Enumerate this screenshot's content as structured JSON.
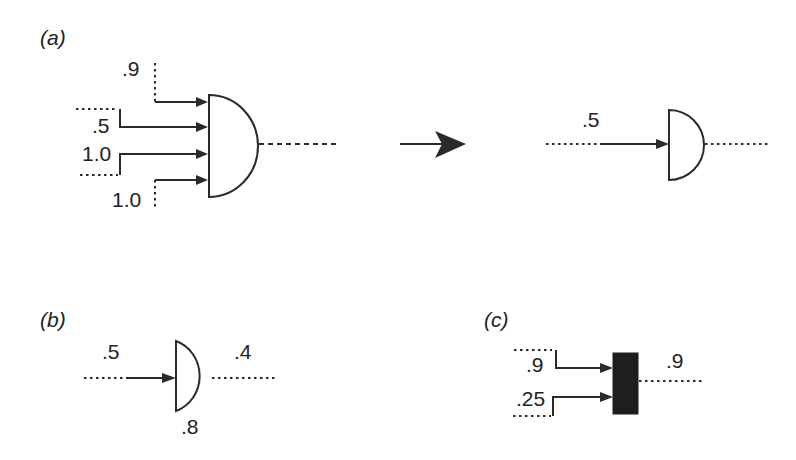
{
  "panels": {
    "a": {
      "label": "(a)",
      "left_gate": {
        "inputs": [
          {
            "value": ".9"
          },
          {
            "value": ".5"
          },
          {
            "value": "1.0"
          },
          {
            "value": "1.0"
          }
        ]
      },
      "transform_arrow": "arrow-right",
      "right_gate": {
        "inputs": [
          {
            "value": ".5"
          }
        ]
      }
    },
    "b": {
      "label": "(b)",
      "input": ".5",
      "output": ".4",
      "gate_value": ".8"
    },
    "c": {
      "label": "(c)",
      "inputs": [
        {
          "value": ".9"
        },
        {
          "value": ".25"
        }
      ],
      "output": ".9"
    }
  },
  "colors": {
    "ink": "#2a2a2a",
    "background": "#ffffff",
    "block": "#1e1e1e"
  }
}
